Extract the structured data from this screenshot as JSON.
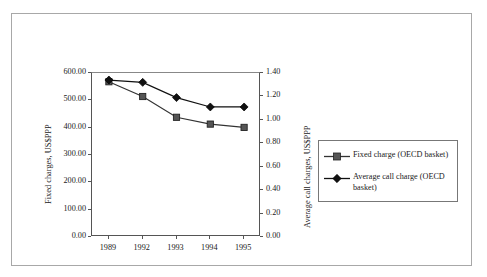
{
  "chart_data": {
    "type": "line",
    "title": "",
    "subtitle": "",
    "xlabel": "",
    "ylabel": "Fixed charges, US$PPP",
    "y2label": "Average call charges, US$PPP",
    "categories": [
      "1989",
      "1992",
      "1993",
      "1994",
      "1995"
    ],
    "grid": false,
    "legend_position": "right",
    "ylim": [
      0,
      600
    ],
    "y2lim": [
      0,
      1.4
    ],
    "yticks": [
      "0.00",
      "100.00",
      "200.00",
      "300.00",
      "400.00",
      "500.00",
      "600.00"
    ],
    "ytick_values": [
      0,
      100,
      200,
      300,
      400,
      500,
      600
    ],
    "y2ticks": [
      "0.00",
      "0.20",
      "0.40",
      "0.60",
      "0.80",
      "1.00",
      "1.20",
      "1.40"
    ],
    "y2tick_values": [
      0,
      0.2,
      0.4,
      0.6,
      0.8,
      1.0,
      1.2,
      1.4
    ],
    "series": [
      {
        "name": "Fixed charge (OECD basket)",
        "axis": "left",
        "marker": "square",
        "color": "#333333",
        "values": [
          568,
          514,
          438,
          413,
          401
        ]
      },
      {
        "name": "Average call charge (OECD basket)",
        "axis": "right",
        "marker": "diamond",
        "color": "#111111",
        "values": [
          1.34,
          1.32,
          1.19,
          1.11,
          1.11
        ]
      }
    ]
  },
  "legend": {
    "entries": [
      {
        "label": "Fixed charge (OECD basket)",
        "marker": "square"
      },
      {
        "label": "Average call charge (OECD basket)",
        "marker": "diamond"
      }
    ]
  },
  "axes": {
    "left_title": "Fixed charges, US$PPP",
    "right_title": "Average call charges, US$PPP"
  },
  "colors": {
    "frame": "#a8a8a8",
    "axis": "#555555",
    "series_fixed": "#333333",
    "series_call": "#111111",
    "background": "#ffffff"
  }
}
